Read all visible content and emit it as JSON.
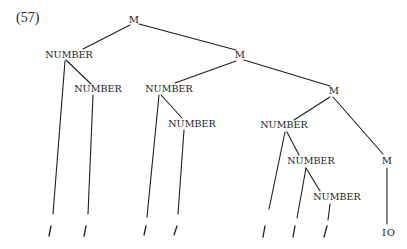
{
  "example_number": "(57)",
  "tree": {
    "nodes": [
      {
        "id": "m1",
        "label": "M",
        "x": 134,
        "y": 20
      },
      {
        "id": "n1",
        "label": "NUMBER",
        "x": 69,
        "y": 55
      },
      {
        "id": "n2",
        "label": "NUMBER",
        "x": 97,
        "y": 89
      },
      {
        "id": "m2",
        "label": "M",
        "x": 240,
        "y": 55
      },
      {
        "id": "n3",
        "label": "NUMBER",
        "x": 169,
        "y": 89
      },
      {
        "id": "n4",
        "label": "NUMBER",
        "x": 192,
        "y": 124
      },
      {
        "id": "m3",
        "label": "M",
        "x": 333,
        "y": 91
      },
      {
        "id": "n5",
        "label": "NUMBER",
        "x": 284,
        "y": 125
      },
      {
        "id": "n6",
        "label": "NUMBER",
        "x": 310,
        "y": 161
      },
      {
        "id": "n7",
        "label": "NUMBER",
        "x": 335,
        "y": 197
      },
      {
        "id": "m4",
        "label": "M",
        "x": 387,
        "y": 161
      }
    ],
    "leaves": [
      {
        "id": "l1",
        "label": "/",
        "x": 50
      },
      {
        "id": "l2",
        "label": "/",
        "x": 85
      },
      {
        "id": "l3",
        "label": "/",
        "x": 145
      },
      {
        "id": "l4",
        "label": "/",
        "x": 175
      },
      {
        "id": "l5",
        "label": "/",
        "x": 263
      },
      {
        "id": "l6",
        "label": "/",
        "x": 294
      },
      {
        "id": "l7",
        "label": "/",
        "x": 325
      },
      {
        "id": "l8",
        "label": "IO",
        "x": 388
      }
    ],
    "edges": [
      [
        "m1",
        "n1"
      ],
      [
        "m1",
        "m2"
      ],
      [
        "n1",
        "n2"
      ],
      [
        "n1",
        "l1"
      ],
      [
        "n2",
        "l2"
      ],
      [
        "m2",
        "n3"
      ],
      [
        "m2",
        "m3"
      ],
      [
        "n3",
        "n4"
      ],
      [
        "n3",
        "l3"
      ],
      [
        "n4",
        "l4"
      ],
      [
        "m3",
        "n5"
      ],
      [
        "m3",
        "m4"
      ],
      [
        "n5",
        "n6"
      ],
      [
        "n5",
        "l5"
      ],
      [
        "n6",
        "n7"
      ],
      [
        "n6",
        "l6"
      ],
      [
        "n7",
        "l7"
      ],
      [
        "m4",
        "l8"
      ]
    ]
  },
  "labels": {
    "m1": "M",
    "n1": "NUMBER",
    "n2": "NUMBER",
    "m2": "M",
    "n3": "NUMBER",
    "n4": "NUMBER",
    "m3": "M",
    "n5": "NUMBER",
    "n6": "NUMBER",
    "n7": "NUMBER",
    "m4": "M",
    "leaf_value": "IO"
  }
}
